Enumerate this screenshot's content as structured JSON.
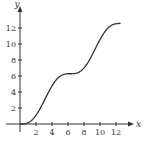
{
  "chart_data": {
    "type": "line",
    "title": "",
    "xlabel": "x",
    "ylabel": "y",
    "xlim": [
      0,
      13
    ],
    "ylim": [
      0,
      13
    ],
    "grid": false,
    "x_ticks": [
      2,
      4,
      6,
      8,
      10,
      12
    ],
    "y_ticks": [
      2,
      4,
      6,
      8,
      10,
      12
    ],
    "series": [
      {
        "name": "y = x - sin x",
        "x": [
          0,
          1,
          2,
          3,
          4,
          5,
          6,
          6.28,
          7,
          8,
          9,
          10,
          11,
          12,
          12.57
        ],
        "y": [
          0,
          0.16,
          1.09,
          2.86,
          4.76,
          5.96,
          6.28,
          6.28,
          6.34,
          7.01,
          8.59,
          10.54,
          12.0,
          12.54,
          12.57
        ]
      }
    ],
    "colors": {
      "curve": "#333333",
      "axis": "#333333"
    }
  }
}
